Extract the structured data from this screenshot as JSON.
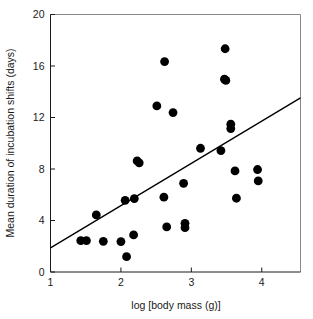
{
  "chart_data": {
    "type": "scatter",
    "title": "",
    "xlabel": "log [body mass (g)]",
    "ylabel": "Mean duration of incubation shifts (days)",
    "xlim": [
      1,
      4.55
    ],
    "ylim": [
      0,
      20
    ],
    "xticks": [
      1,
      2,
      3,
      4
    ],
    "xtick_labels": [
      "1",
      "2",
      "3",
      "4"
    ],
    "yticks": [
      0,
      4,
      8,
      12,
      16,
      20
    ],
    "ytick_labels": [
      "0",
      "4",
      "8",
      "12",
      "16",
      "20"
    ],
    "grid": false,
    "legend": null,
    "marker_color": "#000000",
    "marker_size": 4.4,
    "line_color": "#000000",
    "frame_color": "#8a8a8a",
    "axis_color": "#1a1a1a",
    "series": [
      {
        "name": "Incubation shift duration vs body mass",
        "points": [
          [
            1.43,
            2.43
          ],
          [
            1.51,
            2.43
          ],
          [
            1.65,
            4.43
          ],
          [
            1.75,
            2.38
          ],
          [
            2.0,
            2.36
          ],
          [
            2.06,
            5.57
          ],
          [
            2.08,
            1.19
          ],
          [
            2.18,
            2.88
          ],
          [
            2.19,
            5.7
          ],
          [
            2.23,
            8.63
          ],
          [
            2.26,
            8.48
          ],
          [
            2.51,
            12.9
          ],
          [
            2.61,
            5.81
          ],
          [
            2.62,
            16.34
          ],
          [
            2.65,
            3.5
          ],
          [
            2.74,
            12.38
          ],
          [
            2.89,
            6.89
          ],
          [
            2.91,
            3.78
          ],
          [
            2.91,
            3.44
          ],
          [
            3.13,
            9.61
          ],
          [
            3.42,
            9.43
          ],
          [
            3.47,
            14.98
          ],
          [
            3.49,
            14.88
          ],
          [
            3.48,
            17.34
          ],
          [
            3.56,
            11.48
          ],
          [
            3.56,
            11.14
          ],
          [
            3.62,
            7.85
          ],
          [
            3.64,
            5.73
          ],
          [
            3.94,
            7.96
          ],
          [
            3.95,
            7.07
          ]
        ]
      }
    ],
    "fit_line": {
      "name": "regression-line",
      "x_start": 1.0,
      "y_start": 1.87,
      "x_end": 4.55,
      "y_end": 13.53,
      "slope": 3.28,
      "intercept": -1.41
    }
  }
}
